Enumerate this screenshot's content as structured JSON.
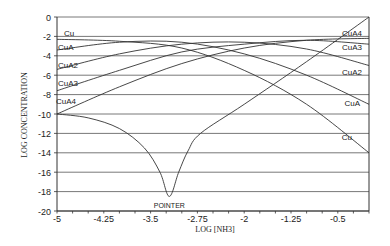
{
  "chart_data": {
    "type": "line",
    "title": "",
    "xlabel": "LOG [NH3]",
    "ylabel": "LOG CONCENTRATION",
    "xlim": [
      -5,
      0
    ],
    "ylim": [
      -20,
      0
    ],
    "x_ticks": [
      "-5",
      "-4.25",
      "-3.5",
      "-2.75",
      "-2",
      "-1.25",
      "-0.5"
    ],
    "x_tick_values": [
      -5,
      -4.25,
      -3.5,
      -2.75,
      -2,
      -1.25,
      -0.5
    ],
    "y_ticks": [
      "0",
      "-2",
      "-4",
      "-6",
      "-8",
      "-10",
      "-12",
      "-14",
      "-16",
      "-18",
      "-20"
    ],
    "y_tick_values": [
      0,
      -2,
      -4,
      -6,
      -8,
      -10,
      -12,
      -14,
      -16,
      -18,
      -20
    ],
    "grid": {
      "horizontal": true,
      "vertical": false
    },
    "series": [
      {
        "name": "Cu",
        "left_label": "Cu",
        "right_label": "Cu",
        "points": [
          [
            -5,
            -2.3
          ],
          [
            -4,
            -2.5
          ],
          [
            -3,
            -3.2
          ],
          [
            -2,
            -5.5
          ],
          [
            -1,
            -9
          ],
          [
            0,
            -14
          ]
        ]
      },
      {
        "name": "CuA",
        "left_label": "CuA",
        "right_label": "CuA",
        "points": [
          [
            -5,
            -3.4
          ],
          [
            -4,
            -2.6
          ],
          [
            -3,
            -2.6
          ],
          [
            -2,
            -3.8
          ],
          [
            -1,
            -6
          ],
          [
            0,
            -9
          ]
        ]
      },
      {
        "name": "CuA2",
        "left_label": "CuA2",
        "right_label": "CuA2",
        "points": [
          [
            -5,
            -5.4
          ],
          [
            -4,
            -3.8
          ],
          [
            -3,
            -2.8
          ],
          [
            -2,
            -2.6
          ],
          [
            -1,
            -3.3
          ],
          [
            0,
            -5
          ]
        ]
      },
      {
        "name": "CuA3",
        "left_label": "CuA3",
        "right_label": "CuA3",
        "points": [
          [
            -5,
            -7.6
          ],
          [
            -4,
            -5.5
          ],
          [
            -3,
            -3.6
          ],
          [
            -2,
            -2.8
          ],
          [
            -1,
            -2.4
          ],
          [
            0,
            -2.8
          ]
        ]
      },
      {
        "name": "CuA4",
        "left_label": "CuA4",
        "right_label": "CuA4",
        "points": [
          [
            -5,
            -10
          ],
          [
            -4,
            -7.2
          ],
          [
            -3,
            -4.8
          ],
          [
            -2,
            -3.2
          ],
          [
            -1,
            -2.4
          ],
          [
            0,
            -2.2
          ]
        ]
      },
      {
        "name": "POINTER",
        "label": "POINTER",
        "points": [
          [
            -5,
            -10
          ],
          [
            -4.5,
            -10.4
          ],
          [
            -4,
            -11.5
          ],
          [
            -3.6,
            -13.5
          ],
          [
            -3.35,
            -16
          ],
          [
            -3.2,
            -18.5
          ],
          [
            -3.05,
            -16
          ],
          [
            -2.9,
            -13.8
          ],
          [
            -2.7,
            -12
          ],
          [
            -2,
            -9
          ],
          [
            -1,
            -4.6
          ],
          [
            0,
            0
          ]
        ]
      }
    ]
  }
}
